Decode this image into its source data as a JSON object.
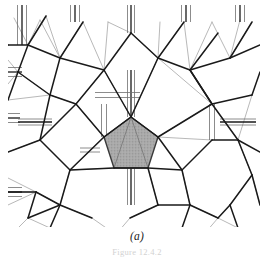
{
  "figure": {
    "panel_label": "(a)",
    "caption_partial": "Figure 12.4.2",
    "background_color": "#ffffff",
    "bold_edge_color": "#1a1a1a",
    "thin_edge_color": "#9a9a9a",
    "mid_edge_color": "#6e6e6e",
    "shaded_cell_fill": "#a9a9a9",
    "shaded_cell_stroke": "#3a3a3a",
    "clip": {
      "x": 8,
      "y": 5,
      "width": 252,
      "height": 222
    },
    "shaded_pentagon": {
      "label": "shaded-pentagon",
      "fill": "#a9a9a9",
      "points": "131,117 158,137 148,168 114,168 104,137"
    },
    "bold_network_edges": [
      "8,45 28,45",
      "28,45 46,16",
      "28,45 18,72",
      "28,45 60,58",
      "60,58 83,22",
      "60,58 50,95",
      "60,58 104,70",
      "104,70 131,33",
      "104,70 131,117",
      "104,70 76,104",
      "131,33 158,58",
      "158,58 184,22",
      "158,58 131,117",
      "158,58 190,70",
      "190,70 218,33",
      "190,70 212,104",
      "190,70 230,58",
      "230,58 252,22",
      "230,58 260,45",
      "18,72 8,100",
      "18,72 50,95",
      "50,95 76,104",
      "50,95 40,140",
      "76,104 104,137",
      "104,137 131,117",
      "131,117 158,137",
      "158,137 212,104",
      "212,104 190,70",
      "212,104 238,140",
      "212,104 252,95",
      "252,95 260,72",
      "40,140 8,152",
      "40,140 76,104",
      "40,140 70,170",
      "70,170 104,137",
      "70,170 114,168",
      "70,170 60,205",
      "114,168 148,168",
      "148,168 182,170",
      "148,168 158,205",
      "182,170 158,137",
      "182,170 212,140",
      "182,170 190,205",
      "212,140 238,140",
      "238,140 260,152",
      "238,140 252,175",
      "60,205 28,218",
      "60,205 92,218",
      "60,205 50,228",
      "158,205 130,218",
      "158,205 190,205",
      "190,205 218,218",
      "190,205 182,228",
      "252,175 260,205",
      "252,175 230,205",
      "230,205 218,218",
      "230,205 238,228",
      "8,192 36,192",
      "36,192 28,218",
      "36,192 60,205",
      "8,45 8,45"
    ],
    "thin_edges": [
      "28,45 46,16",
      "28,45 14,18",
      "28,45 40,20",
      "60,58 40,20",
      "60,58 83,22",
      "46,16 60,58",
      "104,70 83,22",
      "104,70 108,22",
      "131,33 108,22",
      "158,58 131,33",
      "158,58 160,22",
      "184,22 158,58",
      "190,70 184,22",
      "190,70 212,22",
      "230,58 212,22",
      "230,58 240,20",
      "252,22 230,58",
      "18,72 8,60",
      "18,72 8,84",
      "50,95 18,72",
      "50,95 8,100",
      "76,104 50,95",
      "76,104 40,140",
      "104,137 76,104",
      "104,137 70,170",
      "104,70 76,104",
      "131,117 104,70",
      "131,117 158,58",
      "158,137 212,104",
      "212,104 158,58",
      "212,104 190,70",
      "212,140 158,137",
      "212,140 182,170",
      "238,140 212,104",
      "238,140 252,95",
      "252,175 238,140",
      "70,170 40,140",
      "70,170 60,205",
      "114,168 70,170",
      "148,168 158,205",
      "182,170 190,205",
      "36,192 8,178",
      "36,192 8,205",
      "36,192 60,205",
      "60,205 36,192",
      "28,218 50,228",
      "28,218 14,232",
      "60,205 92,218",
      "92,218 112,232",
      "130,218 158,205",
      "130,218 118,232",
      "190,205 218,218",
      "218,218 238,228",
      "218,218 206,232",
      "230,205 252,175",
      "260,205 252,175",
      "8,152 40,140",
      "8,192 36,192"
    ],
    "parallel_bundles": [
      {
        "orientation": "v",
        "x": 22,
        "y1": 5,
        "y2": 45,
        "count": 3,
        "spread": 9
      },
      {
        "orientation": "v",
        "x": 75,
        "y1": 5,
        "y2": 22,
        "count": 3,
        "spread": 9
      },
      {
        "orientation": "v",
        "x": 131,
        "y1": 5,
        "y2": 33,
        "count": 3,
        "spread": 7
      },
      {
        "orientation": "v",
        "x": 186,
        "y1": 5,
        "y2": 22,
        "count": 3,
        "spread": 9
      },
      {
        "orientation": "v",
        "x": 240,
        "y1": 5,
        "y2": 22,
        "count": 3,
        "spread": 9
      },
      {
        "orientation": "h",
        "y": 72,
        "x1": 8,
        "x2": 22,
        "count": 3,
        "spread": 9
      },
      {
        "orientation": "h",
        "y": 118,
        "x1": 8,
        "x2": 20,
        "count": 3,
        "spread": 9
      },
      {
        "orientation": "h",
        "y": 192,
        "x1": 8,
        "x2": 22,
        "count": 3,
        "spread": 9
      },
      {
        "orientation": "v",
        "x": 131,
        "y1": 70,
        "y2": 117,
        "count": 3,
        "spread": 7
      },
      {
        "orientation": "v",
        "x": 131,
        "y1": 168,
        "y2": 205,
        "count": 3,
        "spread": 7
      },
      {
        "orientation": "h",
        "y": 95,
        "x1": 95,
        "x2": 140,
        "count": 2,
        "spread": 5
      },
      {
        "orientation": "h",
        "y": 122,
        "x1": 220,
        "x2": 256,
        "count": 3,
        "spread": 6
      },
      {
        "orientation": "h",
        "y": 122,
        "x1": 18,
        "x2": 52,
        "count": 3,
        "spread": 6
      },
      {
        "orientation": "v",
        "x": 104,
        "y1": 104,
        "y2": 137,
        "count": 2,
        "spread": 5
      },
      {
        "orientation": "v",
        "x": 212,
        "y1": 104,
        "y2": 140,
        "count": 2,
        "spread": 5
      },
      {
        "orientation": "h",
        "y": 150,
        "x1": 80,
        "x2": 100,
        "count": 2,
        "spread": 4
      }
    ]
  }
}
